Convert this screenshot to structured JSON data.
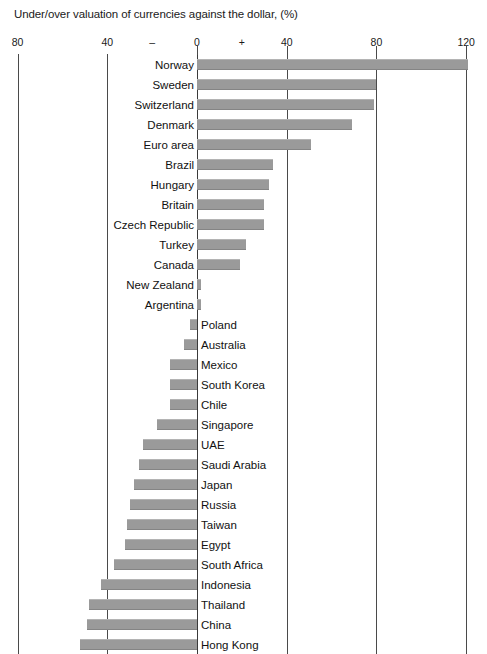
{
  "chart_data": {
    "type": "bar",
    "orientation": "horizontal",
    "title": "Under/over valuation of currencies against the dollar, (%)",
    "xlabel": "",
    "ylabel": "",
    "xlim": [
      -80,
      120
    ],
    "grid": true,
    "legend": "none",
    "axis_ticks": [
      {
        "label": "80",
        "value": -80
      },
      {
        "label": "40",
        "value": -40
      },
      {
        "label": "–",
        "value": -20
      },
      {
        "label": "0",
        "value": 0
      },
      {
        "label": "+",
        "value": 20
      },
      {
        "label": "40",
        "value": 40
      },
      {
        "label": "80",
        "value": 80
      },
      {
        "label": "120",
        "value": 120
      }
    ],
    "gridline_values": [
      -80,
      -40,
      0,
      40,
      80,
      120
    ],
    "bar_color": "#9a9a9a",
    "categories": [
      "Norway",
      "Sweden",
      "Switzerland",
      "Denmark",
      "Euro area",
      "Brazil",
      "Hungary",
      "Britain",
      "Czech Republic",
      "Turkey",
      "Canada",
      "New Zealand",
      "Argentina",
      "Poland",
      "Australia",
      "Mexico",
      "South Korea",
      "Chile",
      "Singapore",
      "UAE",
      "Saudi Arabia",
      "Japan",
      "Russia",
      "Taiwan",
      "Egypt",
      "South Africa",
      "Indonesia",
      "Thailand",
      "China",
      "Hong Kong"
    ],
    "values": [
      121,
      80,
      79,
      69,
      51,
      34,
      32,
      30,
      30,
      22,
      19,
      2,
      2,
      -3,
      -6,
      -12,
      -12,
      -12,
      -18,
      -24,
      -26,
      -28,
      -30,
      -31,
      -32,
      -37,
      -43,
      -48,
      -49,
      -52
    ]
  }
}
